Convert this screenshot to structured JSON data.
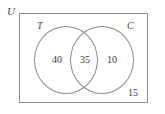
{
  "figure": {
    "type": "venn-diagram",
    "universe_label": "U",
    "sets": [
      {
        "key": "T",
        "label": "T",
        "only_value": "40"
      },
      {
        "key": "C",
        "label": "C",
        "only_value": "10"
      }
    ],
    "intersection_value": "35",
    "outside_value": "15"
  },
  "chart_data": {
    "type": "diagram",
    "subtype": "venn-2-set",
    "title": "",
    "universe_label": "U",
    "set_labels": [
      "T",
      "C"
    ],
    "regions": [
      {
        "name": "T only",
        "label": "T",
        "value": 40
      },
      {
        "name": "T and C",
        "label": "T ∩ C",
        "value": 35
      },
      {
        "name": "C only",
        "label": "C",
        "value": 10
      },
      {
        "name": "outside both (universe only)",
        "label": "U",
        "value": 15
      }
    ],
    "total": 100,
    "grid": false,
    "legend": "none"
  }
}
